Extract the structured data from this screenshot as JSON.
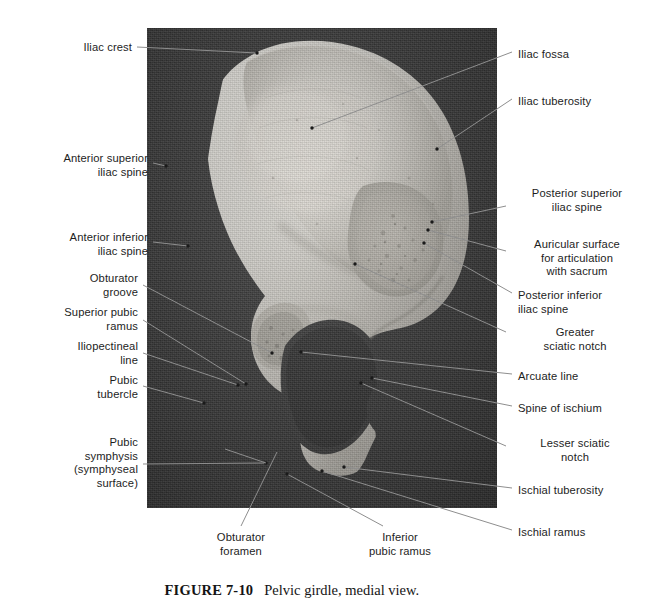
{
  "figure": {
    "number": "FIGURE 7-10",
    "caption": "Pelvic girdle, medial view.",
    "view": "medial view",
    "subject": "Pelvic girdle",
    "photo": {
      "background_color": "#3b3b3b",
      "bone_color": "#cfcdc8",
      "left": 147,
      "top": 28,
      "width": 350,
      "height": 480
    }
  },
  "labels_left": [
    {
      "id": "iliac-crest",
      "text": "Iliac crest",
      "align": "right",
      "x": 14,
      "y": 41,
      "w": 118
    },
    {
      "id": "anterior-superior-iliac-spine",
      "text": "Anterior superior\niliac spine",
      "align": "right",
      "x": 14,
      "y": 152,
      "w": 134
    },
    {
      "id": "anterior-inferior-iliac-spine",
      "text": "Anterior inferior\niliac spine",
      "align": "right",
      "x": 14,
      "y": 231,
      "w": 134
    },
    {
      "id": "obturator-groove",
      "text": "Obturator\ngroove",
      "align": "right",
      "x": 14,
      "y": 272,
      "w": 124
    },
    {
      "id": "superior-pubic-ramus",
      "text": "Superior pubic\nramus",
      "align": "right",
      "x": 14,
      "y": 306,
      "w": 124
    },
    {
      "id": "iliopectineal-line",
      "text": "Iliopectineal\nline",
      "align": "right",
      "x": 14,
      "y": 340,
      "w": 124
    },
    {
      "id": "pubic-tubercle",
      "text": "Pubic\ntubercle",
      "align": "right",
      "x": 14,
      "y": 374,
      "w": 124
    },
    {
      "id": "pubic-symphysis",
      "text": "Pubic\nsymphysis\n(symphyseal\nsurface)",
      "align": "right",
      "x": 14,
      "y": 436,
      "w": 124
    }
  ],
  "labels_right": [
    {
      "id": "iliac-fossa",
      "text": "Iliac fossa",
      "align": "left",
      "x": 518,
      "y": 48,
      "w": 124
    },
    {
      "id": "iliac-tuberosity",
      "text": "Iliac tuberosity",
      "align": "left",
      "x": 518,
      "y": 95,
      "w": 124
    },
    {
      "id": "posterior-superior-iliac-spine",
      "text": "Posterior superior\niliac spine",
      "align": "center",
      "x": 513,
      "y": 187,
      "w": 128
    },
    {
      "id": "auricular-surface",
      "text": "Auricular surface\nfor articulation\nwith sacrum",
      "align": "center",
      "x": 513,
      "y": 238,
      "w": 128
    },
    {
      "id": "posterior-inferior-iliac-spine",
      "text": "Posterior inferior\niliac spine",
      "align": "left",
      "x": 518,
      "y": 289,
      "w": 128
    },
    {
      "id": "greater-sciatic-notch",
      "text": "Greater\nsciatic notch",
      "align": "center",
      "x": 513,
      "y": 326,
      "w": 124
    },
    {
      "id": "arcuate-line",
      "text": "Arcuate line",
      "align": "left",
      "x": 518,
      "y": 370,
      "w": 124
    },
    {
      "id": "spine-of-ischium",
      "text": "Spine of ischium",
      "align": "left",
      "x": 518,
      "y": 402,
      "w": 124
    },
    {
      "id": "lesser-sciatic-notch",
      "text": "Lesser sciatic\nnotch",
      "align": "center",
      "x": 513,
      "y": 437,
      "w": 124
    },
    {
      "id": "ischial-tuberosity",
      "text": "Ischial tuberosity",
      "align": "left",
      "x": 518,
      "y": 484,
      "w": 124
    },
    {
      "id": "ischial-ramus",
      "text": "Ischial ramus",
      "align": "left",
      "x": 518,
      "y": 526,
      "w": 124
    }
  ],
  "labels_bottom": [
    {
      "id": "obturator-foramen",
      "text": "Obturator\nforamen",
      "align": "center",
      "x": 196,
      "y": 531,
      "w": 90
    },
    {
      "id": "inferior-pubic-ramus",
      "text": "Inferior\npubic ramus",
      "align": "center",
      "x": 352,
      "y": 531,
      "w": 96
    }
  ],
  "leaders": [
    {
      "id": "iliac-crest",
      "x1": 137,
      "y1": 47,
      "x2": 257,
      "y2": 53,
      "dot": true
    },
    {
      "id": "anterior-superior-iliac-spine",
      "x1": 153,
      "y1": 163,
      "x2": 166,
      "y2": 166,
      "dot": true
    },
    {
      "id": "anterior-inferior-iliac-spine",
      "x1": 153,
      "y1": 242,
      "x2": 188,
      "y2": 246,
      "dot": true
    },
    {
      "id": "obturator-groove",
      "x1": 143,
      "y1": 285,
      "x2": 272,
      "y2": 353,
      "dot": true
    },
    {
      "id": "superior-pubic-ramus",
      "x1": 143,
      "y1": 320,
      "x2": 246,
      "y2": 384,
      "dot": true
    },
    {
      "id": "iliopectineal-line",
      "x1": 143,
      "y1": 353,
      "x2": 238,
      "y2": 385,
      "dot": true
    },
    {
      "id": "pubic-tubercle",
      "x1": 143,
      "y1": 386,
      "x2": 204,
      "y2": 403,
      "dot": true
    },
    {
      "id": "pubic-symphysis",
      "x1": 143,
      "y1": 464,
      "x2": 266,
      "y2": 463,
      "dot": true
    },
    {
      "id": "pubic-symphysis-2",
      "x1": 225,
      "y1": 449,
      "x2": 266,
      "y2": 463,
      "dot": false
    },
    {
      "id": "iliac-fossa",
      "x1": 512,
      "y1": 52,
      "x2": 312,
      "y2": 128,
      "dot": true
    },
    {
      "id": "iliac-tuberosity",
      "x1": 512,
      "y1": 99,
      "x2": 437,
      "y2": 149,
      "dot": true
    },
    {
      "id": "posterior-superior-iliac-spine",
      "x1": 506,
      "y1": 206,
      "x2": 432,
      "y2": 222,
      "dot": true
    },
    {
      "id": "auricular-surface",
      "x1": 506,
      "y1": 251,
      "x2": 428,
      "y2": 230,
      "dot": true
    },
    {
      "id": "posterior-inferior-iliac-spine",
      "x1": 512,
      "y1": 293,
      "x2": 424,
      "y2": 243,
      "dot": true
    },
    {
      "id": "greater-sciatic-notch",
      "x1": 506,
      "y1": 332,
      "x2": 355,
      "y2": 264,
      "dot": true
    },
    {
      "id": "arcuate-line",
      "x1": 512,
      "y1": 374,
      "x2": 301,
      "y2": 352,
      "dot": true
    },
    {
      "id": "spine-of-ischium",
      "x1": 512,
      "y1": 406,
      "x2": 372,
      "y2": 378,
      "dot": true
    },
    {
      "id": "lesser-sciatic-notch",
      "x1": 506,
      "y1": 446,
      "x2": 361,
      "y2": 383,
      "dot": true
    },
    {
      "id": "ischial-tuberosity",
      "x1": 512,
      "y1": 488,
      "x2": 344,
      "y2": 467,
      "dot": true
    },
    {
      "id": "ischial-ramus",
      "x1": 512,
      "y1": 530,
      "x2": 322,
      "y2": 471,
      "dot": true
    },
    {
      "id": "obturator-foramen",
      "x1": 241,
      "y1": 526,
      "x2": 277,
      "y2": 452,
      "dot": false
    },
    {
      "id": "inferior-pubic-ramus",
      "x1": 383,
      "y1": 526,
      "x2": 287,
      "y2": 474,
      "dot": true
    }
  ]
}
